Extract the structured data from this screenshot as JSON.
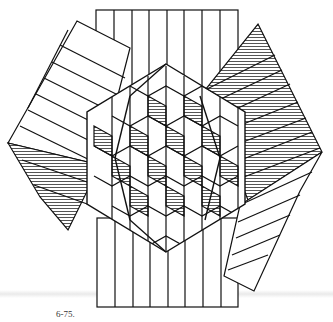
{
  "figure": {
    "caption": "6-75.",
    "colors": {
      "line": "#111111",
      "hatch": "#555555",
      "background": "#ffffff"
    },
    "center": [
      166,
      158
    ],
    "strip_bundles": 3,
    "strips_per_bundle": 8
  }
}
